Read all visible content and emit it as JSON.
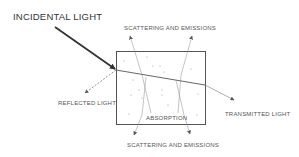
{
  "diagram": {
    "labels": {
      "incident": "INCIDENTAL LIGHT",
      "scatter_top": "SCATTERING AND EMISSIONS",
      "reflected": "REFLECTED LIGHT",
      "transmitted": "TRANSMITTED LIGHT",
      "absorption": "ABSORPTION",
      "scatter_bottom": "SCATTERING AND EMISSIONS"
    },
    "colors": {
      "line": "#444444",
      "box": "#555555",
      "thin": "#777777",
      "text": "#555555"
    }
  }
}
